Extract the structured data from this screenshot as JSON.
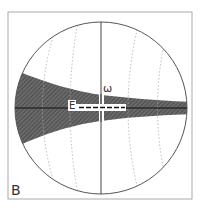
{
  "diagram": {
    "panel_label": "B",
    "omega_label": "ω",
    "e_label": "E",
    "colors": {
      "frame": "#999999",
      "circle": "#555555",
      "shaded": "#555555",
      "great_circles": "#aaaaaa",
      "axis": "#222222"
    }
  }
}
